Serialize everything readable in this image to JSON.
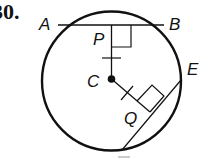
{
  "problem": {
    "number": "30."
  },
  "diagram": {
    "labels": {
      "A": "A",
      "B": "B",
      "P": "P",
      "C": "C",
      "E": "E",
      "Q": "Q"
    },
    "colors": {
      "stroke": "#111111",
      "background": "#ffffff"
    },
    "circle": {
      "cx": 111.5,
      "cy": 81,
      "r": 70
    },
    "center_point": {
      "x": 111.5,
      "y": 79,
      "r": 4
    },
    "chord_AB": {
      "x1": 57,
      "y1": 25,
      "x2": 164,
      "y2": 25
    },
    "chord_E": {
      "x1": 181,
      "y1": 80,
      "x2": 122,
      "y2": 150
    },
    "segment_CP": {
      "x1": 111.5,
      "y1": 79,
      "x2": 111.5,
      "y2": 25
    },
    "segment_CQ": {
      "x1": 111.5,
      "y1": 79,
      "x2": 151,
      "y2": 113
    }
  }
}
